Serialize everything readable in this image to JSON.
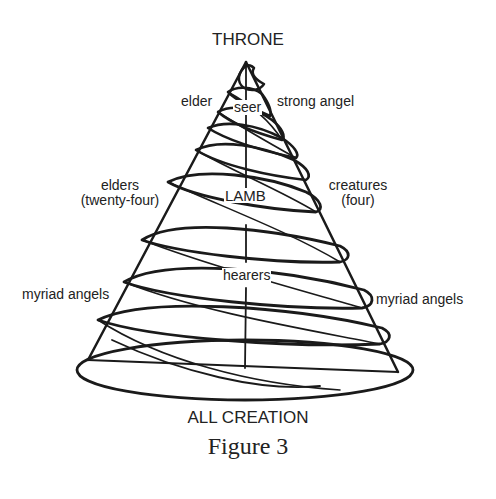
{
  "diagram": {
    "top_label": "THRONE",
    "bottom_label": "ALL CREATION",
    "caption": "Figure 3",
    "labels": {
      "elder": "elder",
      "seer": "seer",
      "strong_angel": "strong angel",
      "elders_line1": "elders",
      "elders_line2": "(twenty-four)",
      "lamb": "LAMB",
      "creatures_line1": "creatures",
      "creatures_line2": "(four)",
      "hearers": "hearers",
      "myriad_angels_left": "myriad angels",
      "myriad_angels_right": "myriad angels"
    },
    "colors": {
      "stroke": "#1a1a1a",
      "text": "#222222",
      "background": "#ffffff"
    }
  }
}
